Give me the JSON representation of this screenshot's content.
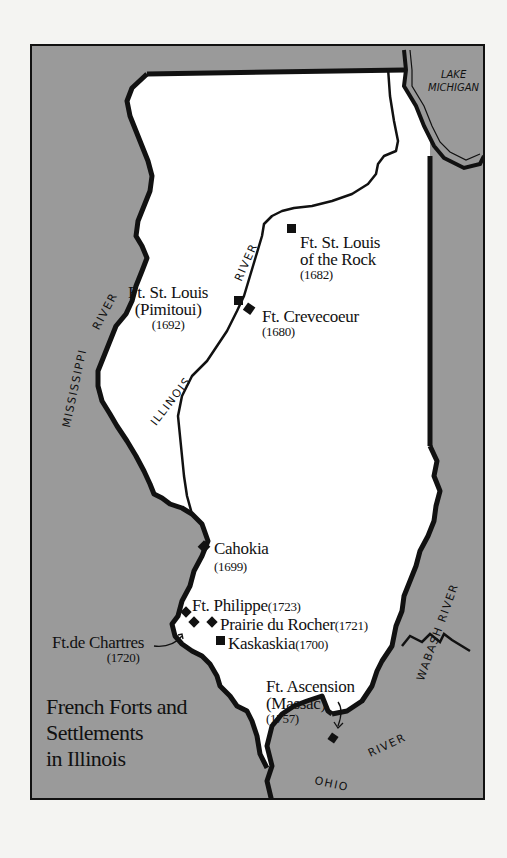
{
  "map": {
    "title_lines": [
      "French Forts and",
      "Settlements",
      "in Illinois"
    ],
    "colors": {
      "land_inside_illinois": "#ffffff",
      "surrounding_area": "#9a9a9a",
      "border_lines": "#111111",
      "page_background": "#f4f4f2"
    },
    "water_labels": {
      "lake": [
        "LAKE",
        "MICHIGAN"
      ],
      "mississippi": "MISSISSIPPI RIVER",
      "mississippi_part1": "MISSISSIPPI",
      "mississippi_part2": "RIVER",
      "illinois_part1": "ILLINOIS",
      "illinois_part2": "RIVER",
      "wabash": "WABASH RIVER",
      "ohio_part1": "OHIO",
      "ohio_part2": "RIVER"
    },
    "sites": [
      {
        "name": "Ft. St. Louis of the Rock",
        "name_lines": [
          "Ft. St. Louis",
          "of the Rock"
        ],
        "year": "(1682)",
        "marker": "square"
      },
      {
        "name": "Ft. St. Louis (Pimitoui)",
        "name_lines": [
          "Ft. St. Louis",
          "(Pimitoui)"
        ],
        "year": "(1692)",
        "marker": "square"
      },
      {
        "name": "Ft. Crevecoeur",
        "name_lines": [
          "Ft. Crevecoeur"
        ],
        "year": "(1680)",
        "marker": "square"
      },
      {
        "name": "Cahokia",
        "name_lines": [
          "Cahokia"
        ],
        "year": "(1699)",
        "marker": "diamond"
      },
      {
        "name": "Ft. Philippe",
        "name_lines": [
          "Ft. Philippe"
        ],
        "year": "(1723)",
        "marker": "diamond"
      },
      {
        "name": "Prairie du Rocher",
        "name_lines": [
          "Prairie du Rocher"
        ],
        "year": "(1721)",
        "marker": "diamond"
      },
      {
        "name": "Kaskaskia",
        "name_lines": [
          "Kaskaskia"
        ],
        "year": "(1700)",
        "marker": "square"
      },
      {
        "name": "Ft. de Chartres",
        "name_lines": [
          "Ft.de Chartres"
        ],
        "year": "(1720)",
        "marker": "diamond"
      },
      {
        "name": "Ft. Ascension (Massac)",
        "name_lines": [
          "Ft. Ascension",
          "(Massac)"
        ],
        "year": "(1757)",
        "marker": "square"
      }
    ]
  }
}
